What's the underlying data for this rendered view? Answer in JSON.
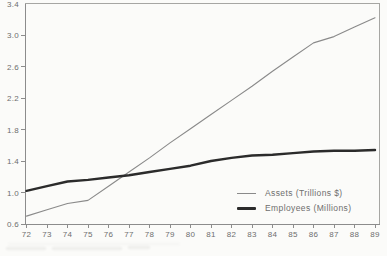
{
  "page": {
    "background": "#fbfbf9"
  },
  "chart_data": {
    "type": "line",
    "title": "",
    "xlabel": "",
    "ylabel": "",
    "categories": [
      "72",
      "73",
      "74",
      "75",
      "76",
      "77",
      "78",
      "79",
      "80",
      "81",
      "82",
      "83",
      "84",
      "85",
      "86",
      "87",
      "88",
      "89"
    ],
    "series": [
      {
        "name": "Assets (Trillions $)",
        "values": [
          0.7,
          0.78,
          0.86,
          0.9,
          1.08,
          1.26,
          1.44,
          1.63,
          1.81,
          1.99,
          2.17,
          2.35,
          2.54,
          2.72,
          2.9,
          2.98,
          3.1,
          3.22
        ],
        "color": "#8a8a8a",
        "stroke_width": 1.1
      },
      {
        "name": "Employees (Millions)",
        "values": [
          1.02,
          1.08,
          1.14,
          1.16,
          1.19,
          1.22,
          1.26,
          1.3,
          1.34,
          1.4,
          1.44,
          1.47,
          1.48,
          1.5,
          1.52,
          1.53,
          1.53,
          1.54
        ],
        "color": "#2b2b2b",
        "stroke_width": 2.4
      }
    ],
    "ylim": [
      0.6,
      3.4
    ],
    "yticks": [
      0.6,
      1.0,
      1.4,
      1.8,
      2.2,
      2.6,
      3.0,
      3.4
    ],
    "ytick_labels": [
      "0.6",
      "1.0",
      "1.4",
      "1.8",
      "2.2",
      "2.6",
      "3.0",
      "3.4"
    ],
    "grid": false,
    "legend_position": "inside-bottom-right",
    "frame_color": "#a6a6a3",
    "axis_color": "#8c8c8c",
    "tick_label_color": "#6e6e6e"
  },
  "legend": {
    "items": [
      {
        "label": "Assets (Trillions $)"
      },
      {
        "label": "Employees (Millions)"
      }
    ]
  }
}
